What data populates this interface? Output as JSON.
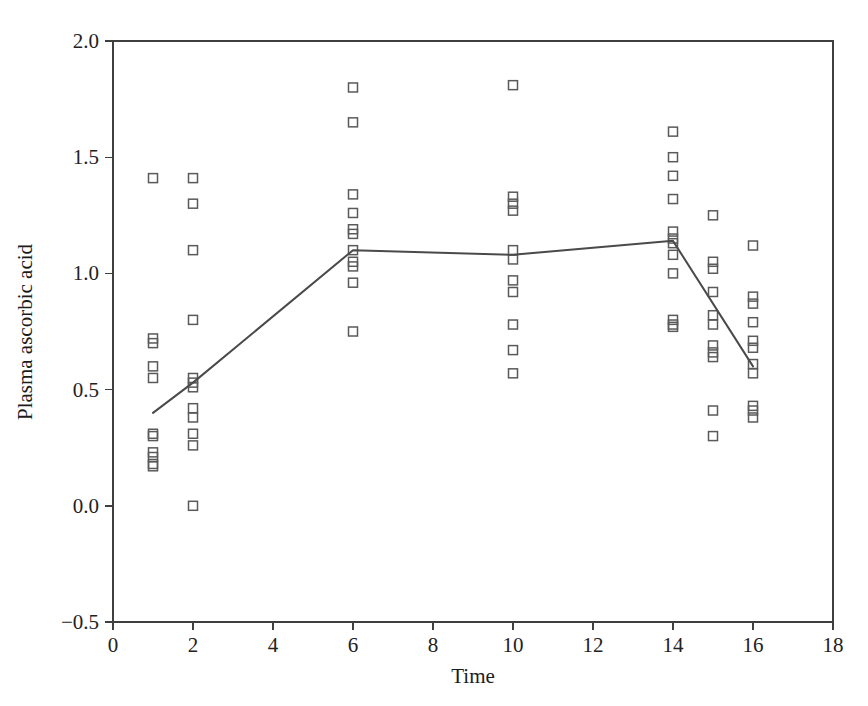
{
  "chart_data": {
    "type": "scatter",
    "title": "",
    "xlabel": "Time",
    "ylabel": "Plasma ascorbic acid",
    "xlim": [
      0,
      18
    ],
    "ylim": [
      -0.5,
      2.0
    ],
    "xticks": [
      0,
      2,
      4,
      6,
      8,
      10,
      12,
      14,
      16,
      18
    ],
    "xtick_labels": [
      "0",
      "2",
      "4",
      "6",
      "8",
      "10",
      "12",
      "14",
      "16",
      "18"
    ],
    "yticks": [
      -0.5,
      0.0,
      0.5,
      1.0,
      1.5,
      2.0
    ],
    "ytick_labels": [
      "−0.5",
      "0.0",
      "0.5",
      "1.0",
      "1.5",
      "2.0"
    ],
    "grid": false,
    "legend": false,
    "marker_shape": "open-square",
    "marker_color": "#5a5a5a",
    "line_color": "#4a4a4a",
    "series": [
      {
        "name": "Individual measurements",
        "type": "scatter",
        "points": [
          [
            1,
            1.41
          ],
          [
            1,
            0.72
          ],
          [
            1,
            0.7
          ],
          [
            1,
            0.6
          ],
          [
            1,
            0.55
          ],
          [
            1,
            0.31
          ],
          [
            1,
            0.3
          ],
          [
            1,
            0.23
          ],
          [
            1,
            0.21
          ],
          [
            1,
            0.18
          ],
          [
            1,
            0.17
          ],
          [
            2,
            1.41
          ],
          [
            2,
            1.3
          ],
          [
            2,
            1.1
          ],
          [
            2,
            0.8
          ],
          [
            2,
            0.55
          ],
          [
            2,
            0.53
          ],
          [
            2,
            0.51
          ],
          [
            2,
            0.42
          ],
          [
            2,
            0.38
          ],
          [
            2,
            0.31
          ],
          [
            2,
            0.26
          ],
          [
            2,
            0.0
          ],
          [
            6,
            1.8
          ],
          [
            6,
            1.65
          ],
          [
            6,
            1.34
          ],
          [
            6,
            1.26
          ],
          [
            6,
            1.19
          ],
          [
            6,
            1.17
          ],
          [
            6,
            1.1
          ],
          [
            6,
            1.05
          ],
          [
            6,
            1.03
          ],
          [
            6,
            0.96
          ],
          [
            6,
            0.75
          ],
          [
            10,
            1.81
          ],
          [
            10,
            1.33
          ],
          [
            10,
            1.3
          ],
          [
            10,
            1.27
          ],
          [
            10,
            1.1
          ],
          [
            10,
            1.06
          ],
          [
            10,
            0.97
          ],
          [
            10,
            0.92
          ],
          [
            10,
            0.78
          ],
          [
            10,
            0.67
          ],
          [
            10,
            0.57
          ],
          [
            14,
            1.61
          ],
          [
            14,
            1.5
          ],
          [
            14,
            1.42
          ],
          [
            14,
            1.32
          ],
          [
            14,
            1.18
          ],
          [
            14,
            1.15
          ],
          [
            14,
            1.13
          ],
          [
            14,
            1.08
          ],
          [
            14,
            1.0
          ],
          [
            14,
            0.8
          ],
          [
            14,
            0.78
          ],
          [
            14,
            0.77
          ],
          [
            15,
            1.25
          ],
          [
            15,
            1.05
          ],
          [
            15,
            1.02
          ],
          [
            15,
            0.92
          ],
          [
            15,
            0.82
          ],
          [
            15,
            0.78
          ],
          [
            15,
            0.69
          ],
          [
            15,
            0.66
          ],
          [
            15,
            0.64
          ],
          [
            15,
            0.41
          ],
          [
            15,
            0.3
          ],
          [
            16,
            1.12
          ],
          [
            16,
            0.9
          ],
          [
            16,
            0.87
          ],
          [
            16,
            0.79
          ],
          [
            16,
            0.71
          ],
          [
            16,
            0.68
          ],
          [
            16,
            0.61
          ],
          [
            16,
            0.57
          ],
          [
            16,
            0.43
          ],
          [
            16,
            0.41
          ],
          [
            16,
            0.38
          ]
        ]
      },
      {
        "name": "Mean trend",
        "type": "line",
        "points": [
          [
            1,
            0.4
          ],
          [
            2,
            0.53
          ],
          [
            6,
            1.1
          ],
          [
            10,
            1.08
          ],
          [
            14,
            1.14
          ],
          [
            16,
            0.6
          ]
        ]
      }
    ]
  }
}
